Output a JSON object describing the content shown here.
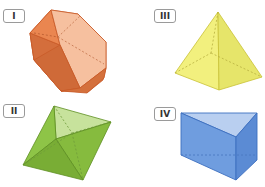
{
  "figures": [
    {
      "id": "I",
      "label": "I",
      "shape": "hexagonal-prism",
      "color": "#e07a45"
    },
    {
      "id": "II",
      "label": "II",
      "shape": "octahedron",
      "color": "#8cc34a"
    },
    {
      "id": "III",
      "label": "III",
      "shape": "square-pyramid",
      "color": "#f0ef7a"
    },
    {
      "id": "IV",
      "label": "IV",
      "shape": "triangular-prism",
      "color": "#6d9be0"
    }
  ]
}
